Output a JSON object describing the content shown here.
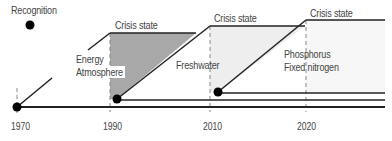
{
  "diagram": {
    "recognition_label": "Recognition",
    "crisis_labels": [
      "Crisis state",
      "Crisis state",
      "Crisis state"
    ],
    "groups": [
      {
        "name": "energy_atmosphere",
        "lines": [
          "Energy",
          "Atmosphere"
        ],
        "start_year": 1970,
        "crisis_year": 1990
      },
      {
        "name": "freshwater",
        "lines": [
          "Freshwater"
        ],
        "start_year": 1990,
        "crisis_year": 2010
      },
      {
        "name": "phosphorus_nitrogen",
        "lines": [
          "Phosphorus",
          "Fixed nitrogen"
        ],
        "start_year": 2010,
        "crisis_year": 2020
      }
    ],
    "axis_ticks": [
      "1970",
      "1990",
      "2010",
      "2020"
    ],
    "colors": {
      "line": "#222222",
      "fill_dark": "#a8a8a8",
      "fill_light": "#ececec",
      "dash": "#888888"
    }
  }
}
